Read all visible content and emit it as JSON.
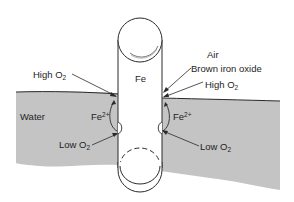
{
  "diagram": {
    "colors": {
      "water": "#c4c4c4",
      "line": "#2a2a2a",
      "background": "#ffffff",
      "rod": "#ffffff"
    },
    "labels": {
      "rod": "Fe",
      "air": "Air",
      "water": "Water",
      "brown_oxide": "Brown iron oxide",
      "high_o2_left": "High O",
      "high_o2_right": "High O",
      "low_o2_left": "Low O",
      "low_o2_right": "Low O",
      "o2_subscript": "2",
      "fe_left": "Fe",
      "fe_right": "Fe",
      "fe_superscript": "2+"
    },
    "regions": [
      {
        "name": "air",
        "label": "Air"
      },
      {
        "name": "water",
        "label": "Water"
      },
      {
        "name": "iron-rod",
        "label": "Fe"
      }
    ]
  }
}
